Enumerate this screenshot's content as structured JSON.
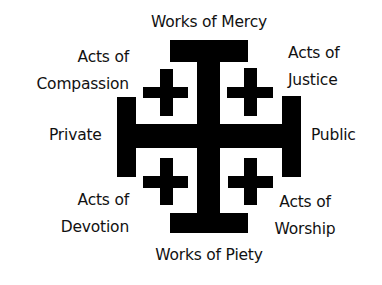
{
  "diagram": {
    "type": "jerusalem-cross",
    "colors": {
      "cross": "#000000",
      "text": "#111111",
      "background": "#ffffff"
    },
    "labels": {
      "top": "Works of Mercy",
      "bottom": "Works of Piety",
      "left": "Private",
      "right": "Public",
      "top_left": {
        "line1": "Acts of",
        "line2": "Compassion"
      },
      "top_right": {
        "line1": "Acts of",
        "line2": "Justice"
      },
      "bottom_left": {
        "line1": "Acts of",
        "line2": "Devotion"
      },
      "bottom_right": {
        "line1": "Acts of",
        "line2": "Worship"
      }
    }
  }
}
